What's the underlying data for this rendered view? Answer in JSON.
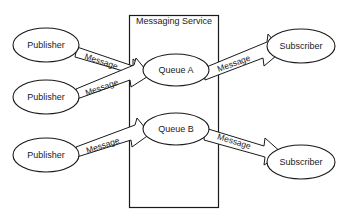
{
  "diagram": {
    "background_color": "#ffffff",
    "stroke_color": "#1a1a1a",
    "fill_color": "#ffffff",
    "container": {
      "label": "Messaging Service",
      "x": 129,
      "y": 15,
      "width": 90,
      "height": 193
    },
    "nodes": [
      {
        "id": "publisher-1",
        "label": "Publisher",
        "type": "ellipse",
        "cx": 46,
        "cy": 45,
        "rx": 33,
        "ry": 17
      },
      {
        "id": "publisher-2",
        "label": "Publisher",
        "type": "ellipse",
        "cx": 46,
        "cy": 97,
        "rx": 33,
        "ry": 17
      },
      {
        "id": "publisher-3",
        "label": "Publisher",
        "type": "ellipse",
        "cx": 46,
        "cy": 155,
        "rx": 33,
        "ry": 17
      },
      {
        "id": "queue-a",
        "label": "Queue A",
        "type": "ellipse",
        "cx": 176,
        "cy": 70,
        "rx": 33,
        "ry": 16
      },
      {
        "id": "queue-b",
        "label": "Queue B",
        "type": "ellipse",
        "cx": 176,
        "cy": 129,
        "rx": 33,
        "ry": 16
      },
      {
        "id": "subscriber-1",
        "label": "Subscriber",
        "type": "ellipse",
        "cx": 301,
        "cy": 46,
        "rx": 34,
        "ry": 17
      },
      {
        "id": "subscriber-2",
        "label": "Subscriber",
        "type": "ellipse",
        "cx": 301,
        "cy": 162,
        "rx": 34,
        "ry": 17
      }
    ],
    "edges": [
      {
        "id": "edge-pub1-queuea",
        "label": "Message",
        "from": "publisher-1",
        "to": "queue-a",
        "direction": "down-right"
      },
      {
        "id": "edge-pub2-queuea",
        "label": "Message",
        "from": "publisher-2",
        "to": "queue-a",
        "direction": "up-right"
      },
      {
        "id": "edge-pub3-queueb",
        "label": "Message",
        "from": "publisher-3",
        "to": "queue-b",
        "direction": "up-right"
      },
      {
        "id": "edge-queuea-sub1",
        "label": "Message",
        "from": "queue-a",
        "to": "subscriber-1",
        "direction": "up-right"
      },
      {
        "id": "edge-queueb-sub2",
        "label": "Message",
        "from": "queue-b",
        "to": "subscriber-2",
        "direction": "down-right"
      }
    ]
  }
}
